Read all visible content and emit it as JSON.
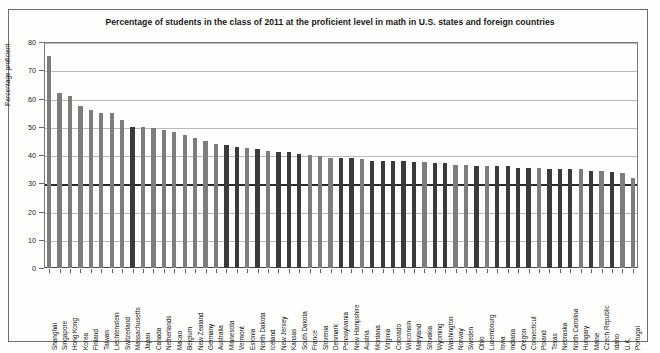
{
  "chart_data": {
    "type": "bar",
    "title": "Percentage of students in the class of 2011 at the proficient level in math in U.S. states and foreign countries",
    "xlabel": "",
    "ylabel": "Percentage proficient",
    "ylim": [
      0,
      80
    ],
    "yticks": [
      0,
      10,
      20,
      30,
      40,
      50,
      60,
      70,
      80
    ],
    "grid": true,
    "legend": "none",
    "series_colors": {
      "us_state": "#3a3a3a",
      "foreign_country": "#7d7d7d"
    },
    "reference_line": 30,
    "categories": [
      "Shanghai",
      "Singapore",
      "Hong Kong",
      "Korea",
      "Finland",
      "Taiwan",
      "Liechtenstein",
      "Switzerland",
      "Massachusetts",
      "Japan",
      "Canada",
      "Netherlands",
      "Macao",
      "Belgium",
      "New Zealand",
      "Germany",
      "Australia",
      "Minnesota",
      "Vermont",
      "Estonia",
      "North Dakota",
      "Iceland",
      "New Jersey",
      "Kansas",
      "South Dakota",
      "France",
      "Slovenia",
      "Denmark",
      "Pennsylvania",
      "New Hampshire",
      "Austria",
      "Montana",
      "Virginia",
      "Colorado",
      "Wisconsin",
      "Maryland",
      "Slovakia",
      "Wyoming",
      "Washington",
      "Norway",
      "Sweden",
      "Ohio",
      "Luxembourg",
      "Iowa",
      "Indiana",
      "Oregon",
      "Connecticut",
      "Poland",
      "Texas",
      "Nebraska",
      "North Carolina",
      "Hungary",
      "Maine",
      "Czech Republic",
      "Idaho",
      "U.K.",
      "Portugal"
    ],
    "values": [
      75.0,
      62.0,
      61.0,
      57.5,
      56.0,
      55.0,
      55.0,
      52.5,
      50.0,
      50.0,
      49.5,
      49.0,
      48.0,
      47.0,
      46.0,
      45.0,
      44.0,
      43.5,
      43.0,
      42.5,
      42.0,
      41.5,
      41.0,
      41.0,
      40.5,
      40.0,
      39.5,
      39.0,
      39.0,
      39.0,
      38.5,
      38.0,
      38.0,
      38.0,
      38.0,
      37.5,
      37.5,
      37.0,
      37.0,
      36.5,
      36.5,
      36.0,
      36.0,
      36.0,
      36.0,
      35.5,
      35.5,
      35.5,
      35.0,
      35.0,
      35.0,
      35.0,
      34.5,
      34.5,
      34.0,
      33.5,
      32.0
    ],
    "kinds": [
      "foreign_country",
      "foreign_country",
      "foreign_country",
      "foreign_country",
      "foreign_country",
      "foreign_country",
      "foreign_country",
      "foreign_country",
      "us_state",
      "foreign_country",
      "foreign_country",
      "foreign_country",
      "foreign_country",
      "foreign_country",
      "foreign_country",
      "foreign_country",
      "foreign_country",
      "us_state",
      "us_state",
      "foreign_country",
      "us_state",
      "foreign_country",
      "us_state",
      "us_state",
      "us_state",
      "foreign_country",
      "foreign_country",
      "foreign_country",
      "us_state",
      "us_state",
      "foreign_country",
      "us_state",
      "us_state",
      "us_state",
      "us_state",
      "us_state",
      "foreign_country",
      "us_state",
      "us_state",
      "foreign_country",
      "foreign_country",
      "us_state",
      "foreign_country",
      "us_state",
      "us_state",
      "us_state",
      "us_state",
      "foreign_country",
      "us_state",
      "us_state",
      "us_state",
      "foreign_country",
      "us_state",
      "foreign_country",
      "us_state",
      "foreign_country",
      "foreign_country"
    ]
  }
}
